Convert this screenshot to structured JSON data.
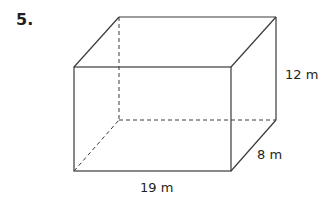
{
  "problem": {
    "number": "5."
  },
  "figure": {
    "type": "rectangular prism",
    "dimensions": {
      "length": "19 m",
      "width": "8 m",
      "height": "12 m"
    },
    "vertices": {
      "front_top_left": [
        74,
        67
      ],
      "front_top_right": [
        231,
        67
      ],
      "front_bottom_left": [
        74,
        171
      ],
      "front_bottom_right": [
        231,
        171
      ],
      "back_top_left": [
        119,
        17
      ],
      "back_top_right": [
        276,
        17
      ],
      "back_bottom_left": [
        119,
        120
      ],
      "back_bottom_right": [
        276,
        120
      ]
    },
    "colors": {
      "line": "#3a3a3a",
      "text": "#231f20",
      "background": "#ffffff"
    }
  }
}
